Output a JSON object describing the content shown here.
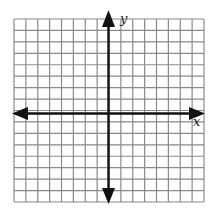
{
  "grid": {
    "columns": 16,
    "rows": 16,
    "line_color": "#8a8a8a",
    "axis_color": "#111111"
  },
  "axes": {
    "x_label": "x",
    "y_label": "y"
  }
}
